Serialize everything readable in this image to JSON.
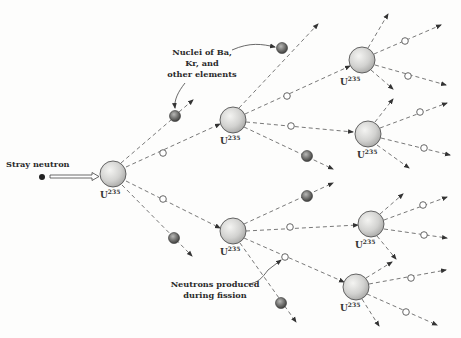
{
  "diagram": {
    "labels": {
      "stray_neutron": "Stray neutron",
      "nuclei": [
        "Nuclei of Ba,",
        "Kr, and",
        "other elements"
      ],
      "neutrons_produced": [
        "Neutrons produced",
        "during fission"
      ],
      "uranium": "U",
      "uranium_mass": "235"
    },
    "generations": [
      {
        "generation": 1,
        "nuclei_count": 1
      },
      {
        "generation": 2,
        "nuclei_count": 2
      },
      {
        "generation": 3,
        "nuclei_count": 4
      }
    ],
    "colors": {
      "nucleus_fill": "#d6d6d4",
      "fragment_fill": "#6e6e6c",
      "line": "#555555",
      "background": "#fdfdfc"
    }
  }
}
